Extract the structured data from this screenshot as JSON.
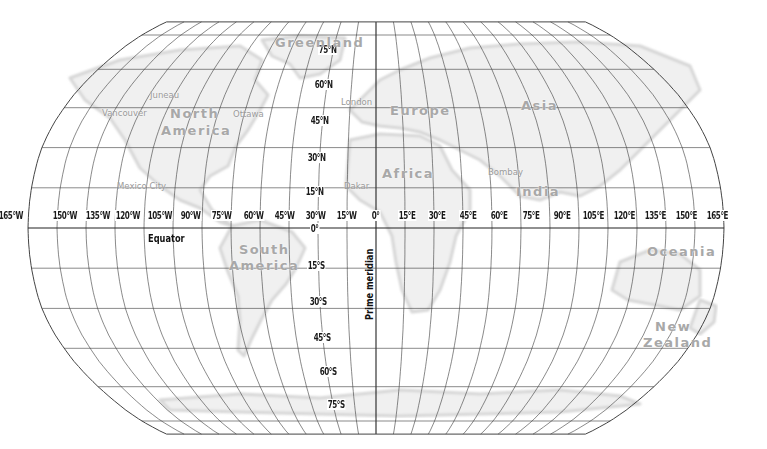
{
  "map": {
    "projection": "Robinson-style world map with graticule",
    "labels": {
      "equator": "Equator",
      "prime_meridian": "Prime meridian",
      "zero_degree_lat": "0°",
      "zero_degree_lon": "0°"
    },
    "latitude_labels": [
      {
        "text": "75°N",
        "x": 318,
        "y": 44
      },
      {
        "text": "60°N",
        "x": 314,
        "y": 79
      },
      {
        "text": "45°N",
        "x": 310,
        "y": 115
      },
      {
        "text": "30°N",
        "x": 307,
        "y": 152
      },
      {
        "text": "15°N",
        "x": 305,
        "y": 186
      },
      {
        "text": "15°S",
        "x": 307,
        "y": 260
      },
      {
        "text": "30°S",
        "x": 309,
        "y": 296
      },
      {
        "text": "45°S",
        "x": 313,
        "y": 332
      },
      {
        "text": "60°S",
        "x": 319,
        "y": 366
      },
      {
        "text": "75°S",
        "x": 327,
        "y": 399
      }
    ],
    "longitude_labels": [
      {
        "text": "165°W",
        "x": -2
      },
      {
        "text": "150°W",
        "x": 52
      },
      {
        "text": "135°W",
        "x": 85
      },
      {
        "text": "120°W",
        "x": 115
      },
      {
        "text": "105°W",
        "x": 147
      },
      {
        "text": "90°W",
        "x": 180
      },
      {
        "text": "75°W",
        "x": 211
      },
      {
        "text": "60°W",
        "x": 243
      },
      {
        "text": "45°W",
        "x": 274
      },
      {
        "text": "30°W",
        "x": 305
      },
      {
        "text": "15°W",
        "x": 336
      },
      {
        "text": "0°",
        "x": 371
      },
      {
        "text": "15°E",
        "x": 398
      },
      {
        "text": "30°E",
        "x": 428
      },
      {
        "text": "45°E",
        "x": 459
      },
      {
        "text": "60°E",
        "x": 490
      },
      {
        "text": "75°E",
        "x": 522
      },
      {
        "text": "90°E",
        "x": 553
      },
      {
        "text": "105°E",
        "x": 582
      },
      {
        "text": "120°E",
        "x": 613
      },
      {
        "text": "135°E",
        "x": 644
      },
      {
        "text": "150°E",
        "x": 675
      },
      {
        "text": "165°E",
        "x": 706
      }
    ],
    "regions": [
      {
        "name": "Greenland",
        "x": 275,
        "y": 36
      },
      {
        "name": "North",
        "x": 170,
        "y": 107
      },
      {
        "name": "America",
        "x": 161,
        "y": 124
      },
      {
        "name": "Europe",
        "x": 390,
        "y": 104
      },
      {
        "name": "Asia",
        "x": 521,
        "y": 99
      },
      {
        "name": "Africa",
        "x": 382,
        "y": 167
      },
      {
        "name": "India",
        "x": 516,
        "y": 185
      },
      {
        "name": "South",
        "x": 239,
        "y": 243
      },
      {
        "name": "America",
        "x": 229,
        "y": 259
      },
      {
        "name": "Oceania",
        "x": 647,
        "y": 245
      },
      {
        "name": "New",
        "x": 655,
        "y": 320
      },
      {
        "name": "Zealand",
        "x": 643,
        "y": 336
      }
    ],
    "cities": [
      {
        "name": "Juneau",
        "x": 150,
        "y": 90
      },
      {
        "name": "Vancouver",
        "x": 102,
        "y": 108
      },
      {
        "name": "Ottawa",
        "x": 233,
        "y": 109
      },
      {
        "name": "London",
        "x": 341,
        "y": 97
      },
      {
        "name": "Mexico City",
        "x": 117,
        "y": 181
      },
      {
        "name": "Dakar",
        "x": 344,
        "y": 181
      },
      {
        "name": "Bombay",
        "x": 488,
        "y": 167
      }
    ],
    "colors": {
      "grid": "#3a3a3a",
      "land_fill": "#f0f0f0",
      "land_outline": "#d6d6d6",
      "region_text": "#a8a8a8",
      "city_text": "#9a9a9a",
      "label_text": "#1a1a1a"
    }
  }
}
